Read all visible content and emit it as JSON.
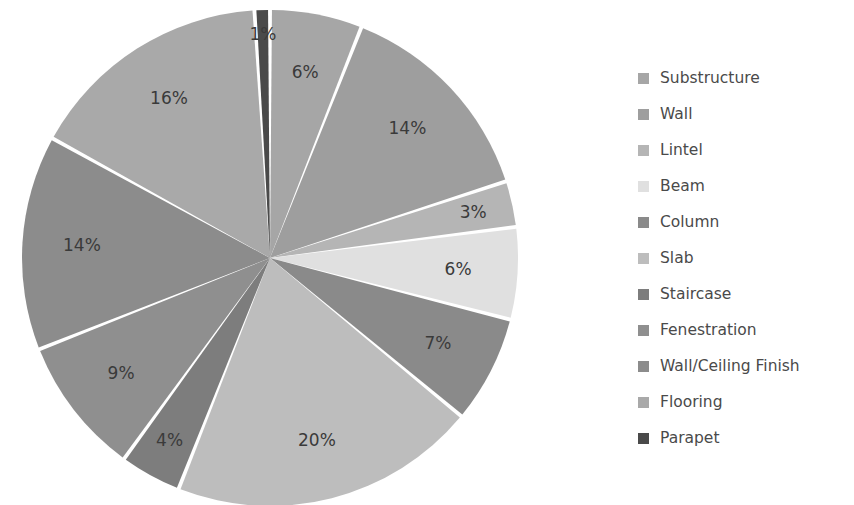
{
  "chart_data": {
    "type": "pie",
    "title": "",
    "labels": [
      "Substructure",
      "Wall",
      "Lintel",
      "Beam",
      "Column",
      "Slab",
      "Staircase",
      "Fenestration",
      "Wall/Ceiling Finish",
      "Flooring",
      "Parapet"
    ],
    "values": [
      6,
      14,
      3,
      6,
      7,
      20,
      4,
      9,
      14,
      16,
      1
    ],
    "value_labels": [
      "6%",
      "14%",
      "3%",
      "6%",
      "7%",
      "20%",
      "4%",
      "9%",
      "14%",
      "16%",
      "1%"
    ],
    "colors": [
      "#a6a6a6",
      "#9e9e9e",
      "#b5b5b5",
      "#e0e0e0",
      "#8a8a8a",
      "#bdbdbd",
      "#7d7d7d",
      "#8f8f8f",
      "#8c8c8c",
      "#a9a9a9",
      "#4a4a4a"
    ],
    "legend_position": "right",
    "grid": false,
    "start_angle_deg": 0,
    "direction": "clockwise",
    "slice_gap": true,
    "units": "percent"
  },
  "legend": {
    "items": [
      {
        "label": "Substructure",
        "color": "#a6a6a6"
      },
      {
        "label": "Wall",
        "color": "#9e9e9e"
      },
      {
        "label": "Lintel",
        "color": "#b5b5b5"
      },
      {
        "label": "Beam",
        "color": "#e0e0e0"
      },
      {
        "label": "Column",
        "color": "#8a8a8a"
      },
      {
        "label": "Slab",
        "color": "#bdbdbd"
      },
      {
        "label": "Staircase",
        "color": "#7d7d7d"
      },
      {
        "label": "Fenestration",
        "color": "#8f8f8f"
      },
      {
        "label": "Wall/Ceiling Finish",
        "color": "#8c8c8c"
      },
      {
        "label": "Flooring",
        "color": "#a9a9a9"
      },
      {
        "label": "Parapet",
        "color": "#4a4a4a"
      }
    ]
  },
  "pie_geometry": {
    "cx": 270,
    "cy": 258,
    "r": 248,
    "label_radius_factor": 0.76
  }
}
